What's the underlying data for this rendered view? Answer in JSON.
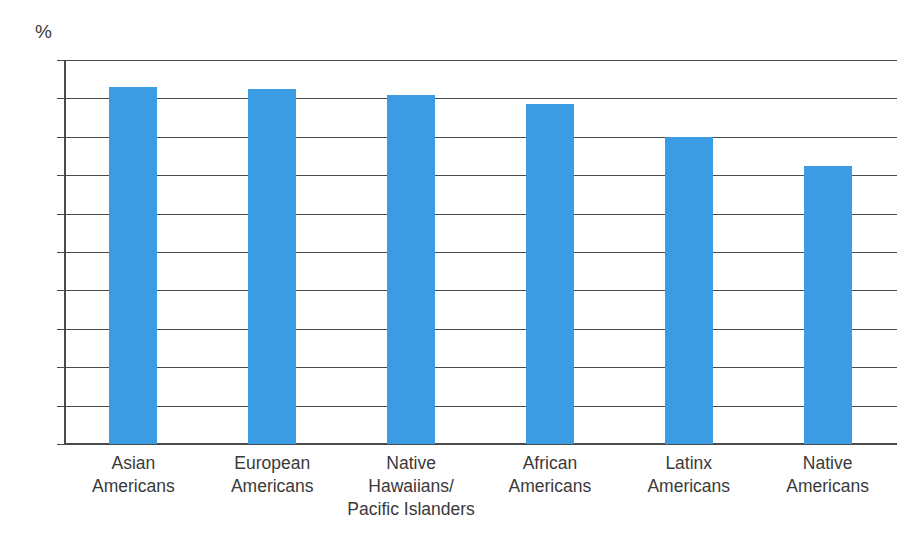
{
  "chart_data": {
    "type": "bar",
    "title": "",
    "subtitle": "",
    "xlabel": "",
    "ylabel": "",
    "unit_label": "%",
    "categories": [
      "Asian\nAmericans",
      "European\nAmericans",
      "Native\nHawaiians/\nPacific Islanders",
      "African\nAmericans",
      "Latinx\nAmericans",
      "Native\nAmericans"
    ],
    "values": [
      93,
      92.5,
      91,
      88.5,
      80,
      72.5
    ],
    "ylim": [
      0,
      100
    ],
    "ytick_labels": [
      "100",
      "90",
      "80",
      "70",
      "60",
      "50",
      "40",
      "30",
      "20",
      "10",
      "0"
    ],
    "ytick_values": [
      100,
      90,
      80,
      70,
      60,
      50,
      40,
      30,
      20,
      10,
      0
    ],
    "grid": true,
    "legend": false,
    "legend_position": "none",
    "bar_color": "#3c9ce3",
    "axis_color": "#4a4a4a",
    "text_color": "#3a3a3a",
    "background_color": "#ffffff"
  }
}
